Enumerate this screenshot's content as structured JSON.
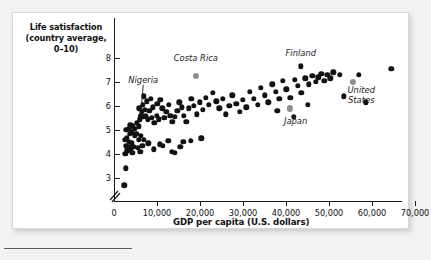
{
  "figure": {
    "background_color": "#f2f2f2",
    "card_color": "#ffffff",
    "point_color": "#121212",
    "highlight_color": "#8d8d8d"
  },
  "chart_data": {
    "type": "scatter",
    "title": "",
    "ylabel": "Life satisfaction\n(country average,\n0–10)",
    "ylabel_lines": [
      "Life satisfaction",
      "(country average,",
      "0–10)"
    ],
    "xlabel": "GDP per capita (U.S. dollars)",
    "xlim": [
      0,
      72000
    ],
    "ylim": [
      2.4,
      8.4
    ],
    "axis_break": true,
    "grid": false,
    "legend": "none",
    "xticks": [
      0,
      10000,
      20000,
      30000,
      40000,
      50000,
      60000,
      70000
    ],
    "xtick_labels": [
      "0",
      "10,000",
      "20,000",
      "30,000",
      "40,000",
      "50,000",
      "60,000",
      "70,000"
    ],
    "yticks": [
      3,
      4,
      5,
      6,
      7,
      8
    ],
    "ytick_labels": [
      "3",
      "4",
      "5",
      "6",
      "7",
      "8"
    ],
    "annotations": [
      {
        "label": "Nigeria",
        "x": 6200,
        "y": 5.6,
        "text_x": 6800,
        "text_y": 7.05,
        "leader": true,
        "highlight": false
      },
      {
        "label": "Costa Rica",
        "x": 19000,
        "y": 7.25,
        "text_x": 19000,
        "text_y": 7.95,
        "leader": false,
        "highlight": true
      },
      {
        "label": "Finland",
        "x": 43500,
        "y": 7.65,
        "text_x": 43500,
        "text_y": 8.18,
        "leader": false,
        "highlight": false
      },
      {
        "label": "Japan",
        "x": 41000,
        "y": 5.9,
        "text_x": 42200,
        "text_y": 5.35,
        "leader": false,
        "highlight": true
      },
      {
        "label": "United States",
        "x": 55500,
        "y": 7.0,
        "text_x": 57500,
        "text_y": 6.62,
        "leader": false,
        "highlight": true
      }
    ],
    "points": [
      {
        "x": 2400,
        "y": 2.7
      },
      {
        "x": 2800,
        "y": 3.4
      },
      {
        "x": 2600,
        "y": 4.0
      },
      {
        "x": 3100,
        "y": 4.15
      },
      {
        "x": 2700,
        "y": 4.35
      },
      {
        "x": 3300,
        "y": 4.3
      },
      {
        "x": 2500,
        "y": 4.6
      },
      {
        "x": 3000,
        "y": 4.65
      },
      {
        "x": 3500,
        "y": 4.5
      },
      {
        "x": 3900,
        "y": 4.2
      },
      {
        "x": 4300,
        "y": 4.05
      },
      {
        "x": 4100,
        "y": 4.45
      },
      {
        "x": 4600,
        "y": 4.3
      },
      {
        "x": 3700,
        "y": 4.85
      },
      {
        "x": 4200,
        "y": 4.9
      },
      {
        "x": 4800,
        "y": 4.75
      },
      {
        "x": 2900,
        "y": 5.0
      },
      {
        "x": 3400,
        "y": 5.05
      },
      {
        "x": 3800,
        "y": 5.2
      },
      {
        "x": 4400,
        "y": 5.15
      },
      {
        "x": 4900,
        "y": 5.05
      },
      {
        "x": 5300,
        "y": 5.3
      },
      {
        "x": 5700,
        "y": 5.15
      },
      {
        "x": 5200,
        "y": 4.85
      },
      {
        "x": 5800,
        "y": 4.6
      },
      {
        "x": 5500,
        "y": 4.25
      },
      {
        "x": 6100,
        "y": 4.1
      },
      {
        "x": 6600,
        "y": 4.35
      },
      {
        "x": 6300,
        "y": 4.75
      },
      {
        "x": 6900,
        "y": 4.6
      },
      {
        "x": 6200,
        "y": 5.6
      },
      {
        "x": 6000,
        "y": 5.45
      },
      {
        "x": 5900,
        "y": 5.9
      },
      {
        "x": 6400,
        "y": 5.75
      },
      {
        "x": 6800,
        "y": 5.55
      },
      {
        "x": 6700,
        "y": 6.05
      },
      {
        "x": 7200,
        "y": 5.85
      },
      {
        "x": 7000,
        "y": 6.4
      },
      {
        "x": 7600,
        "y": 6.2
      },
      {
        "x": 7400,
        "y": 5.6
      },
      {
        "x": 7900,
        "y": 5.45
      },
      {
        "x": 8200,
        "y": 5.8
      },
      {
        "x": 8600,
        "y": 6.3
      },
      {
        "x": 9000,
        "y": 5.95
      },
      {
        "x": 8800,
        "y": 5.5
      },
      {
        "x": 9400,
        "y": 5.3
      },
      {
        "x": 9900,
        "y": 5.6
      },
      {
        "x": 10400,
        "y": 5.45
      },
      {
        "x": 10100,
        "y": 6.1
      },
      {
        "x": 10800,
        "y": 6.25
      },
      {
        "x": 11200,
        "y": 5.9
      },
      {
        "x": 11700,
        "y": 5.5
      },
      {
        "x": 12200,
        "y": 5.75
      },
      {
        "x": 12800,
        "y": 6.05
      },
      {
        "x": 13100,
        "y": 5.6
      },
      {
        "x": 13600,
        "y": 5.35
      },
      {
        "x": 14100,
        "y": 5.55
      },
      {
        "x": 14700,
        "y": 5.8
      },
      {
        "x": 15200,
        "y": 6.15
      },
      {
        "x": 15800,
        "y": 5.95
      },
      {
        "x": 16300,
        "y": 5.6
      },
      {
        "x": 16800,
        "y": 5.35
      },
      {
        "x": 17400,
        "y": 5.9
      },
      {
        "x": 18000,
        "y": 6.3
      },
      {
        "x": 18600,
        "y": 6.0
      },
      {
        "x": 19200,
        "y": 5.65
      },
      {
        "x": 20000,
        "y": 6.15
      },
      {
        "x": 20700,
        "y": 5.85
      },
      {
        "x": 21400,
        "y": 6.35
      },
      {
        "x": 22100,
        "y": 6.05
      },
      {
        "x": 10600,
        "y": 4.4
      },
      {
        "x": 11400,
        "y": 4.35
      },
      {
        "x": 12600,
        "y": 4.55
      },
      {
        "x": 13400,
        "y": 4.1
      },
      {
        "x": 14200,
        "y": 4.05
      },
      {
        "x": 15400,
        "y": 4.3
      },
      {
        "x": 16100,
        "y": 4.5
      },
      {
        "x": 17900,
        "y": 4.55
      },
      {
        "x": 20300,
        "y": 4.65
      },
      {
        "x": 8000,
        "y": 4.45
      },
      {
        "x": 9200,
        "y": 4.2
      },
      {
        "x": 23000,
        "y": 6.55
      },
      {
        "x": 23800,
        "y": 6.2
      },
      {
        "x": 24500,
        "y": 5.9
      },
      {
        "x": 25300,
        "y": 6.3
      },
      {
        "x": 26000,
        "y": 5.65
      },
      {
        "x": 26800,
        "y": 6.0
      },
      {
        "x": 27500,
        "y": 6.45
      },
      {
        "x": 28400,
        "y": 6.1
      },
      {
        "x": 29200,
        "y": 5.75
      },
      {
        "x": 30000,
        "y": 6.25
      },
      {
        "x": 30800,
        "y": 5.95
      },
      {
        "x": 31600,
        "y": 6.6
      },
      {
        "x": 32500,
        "y": 6.3
      },
      {
        "x": 33400,
        "y": 6.05
      },
      {
        "x": 34200,
        "y": 6.75
      },
      {
        "x": 35000,
        "y": 6.45
      },
      {
        "x": 35900,
        "y": 6.15
      },
      {
        "x": 36800,
        "y": 6.9
      },
      {
        "x": 37600,
        "y": 6.6
      },
      {
        "x": 38400,
        "y": 6.3
      },
      {
        "x": 39200,
        "y": 7.05
      },
      {
        "x": 40100,
        "y": 6.7
      },
      {
        "x": 41000,
        "y": 6.35
      },
      {
        "x": 42000,
        "y": 7.1
      },
      {
        "x": 42800,
        "y": 6.85
      },
      {
        "x": 43600,
        "y": 6.55
      },
      {
        "x": 44500,
        "y": 7.15
      },
      {
        "x": 45300,
        "y": 6.9
      },
      {
        "x": 46100,
        "y": 7.25
      },
      {
        "x": 46900,
        "y": 7.0
      },
      {
        "x": 47500,
        "y": 7.2
      },
      {
        "x": 48200,
        "y": 7.35
      },
      {
        "x": 48900,
        "y": 7.05
      },
      {
        "x": 49600,
        "y": 7.3
      },
      {
        "x": 50300,
        "y": 7.15
      },
      {
        "x": 51000,
        "y": 7.4
      },
      {
        "x": 38000,
        "y": 5.8
      },
      {
        "x": 41800,
        "y": 5.55
      },
      {
        "x": 45000,
        "y": 6.05
      },
      {
        "x": 52500,
        "y": 7.3
      },
      {
        "x": 53500,
        "y": 6.4
      },
      {
        "x": 57000,
        "y": 7.3
      },
      {
        "x": 58500,
        "y": 6.15
      },
      {
        "x": 64500,
        "y": 7.55
      }
    ]
  }
}
